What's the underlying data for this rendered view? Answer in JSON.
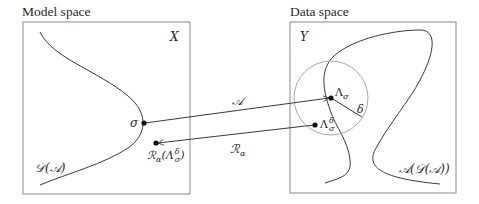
{
  "model_space": {
    "title": "Model space",
    "set_label": "X",
    "curve_label": "𝒟(𝒜)",
    "point_sigma": "σ",
    "point_reconstruction": "ℛ",
    "point_reconstruction_sub": "α",
    "point_reconstruction_arg": "(Λ",
    "point_reconstruction_arg_sup": "δ",
    "point_reconstruction_arg_sub": "σ",
    "point_reconstruction_close": ")"
  },
  "data_space": {
    "title": "Data space",
    "set_label": "Y",
    "curve_label": "𝒜(𝒟(𝒜))",
    "point_lambda": "Λ",
    "point_lambda_sub": "σ",
    "point_lambda_delta": "Λ",
    "point_lambda_delta_sup": "δ",
    "point_lambda_delta_sub": "σ",
    "radius_label": "δ"
  },
  "arrows": {
    "forward_operator": "𝒜",
    "inverse_operator": "ℛ",
    "inverse_operator_sub": "α"
  },
  "colors": {
    "line": "#3a3a3a",
    "box": "#8a8a8a",
    "circle": "#a8a8a8",
    "point": "#111111"
  }
}
